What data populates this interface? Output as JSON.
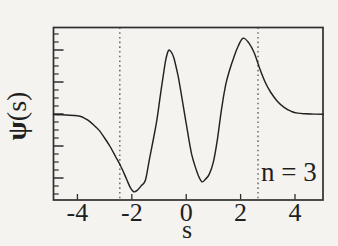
{
  "figure": {
    "ylabel_psi": "ψ",
    "ylabel_rest": "(s)"
  },
  "chart_data": {
    "type": "line",
    "title": "",
    "xlabel": "s",
    "ylabel": "ψ(s)",
    "annotation": "n = 3",
    "grid": false,
    "legend": "none",
    "xlim": [
      -4.88,
      5.03
    ],
    "ylim": [
      -1.117,
      1.13
    ],
    "x_ticks": [
      -4,
      -2,
      0,
      2,
      4
    ],
    "x_tick_labels": [
      "-4",
      "-2",
      "0",
      "2",
      "4"
    ],
    "y_axis": {
      "labeled": false,
      "minor_tick_count": 21,
      "major_every": 4,
      "major_start_index": 2
    },
    "dotted_vlines": [
      -2.44,
      2.64
    ],
    "series": [
      {
        "name": "psi(s), n = 3",
        "x": [
          -4.88,
          -4.6,
          -4.3,
          -4.0,
          -3.8,
          -3.6,
          -3.4,
          -3.2,
          -3.0,
          -2.8,
          -2.6,
          -2.4,
          -2.2,
          -2.05,
          -1.93,
          -1.8,
          -1.65,
          -1.5,
          -1.35,
          -1.2,
          -1.08,
          -0.95,
          -0.85,
          -0.75,
          -0.65,
          -0.55,
          -0.45,
          -0.3,
          -0.2,
          -0.1,
          0.0,
          0.1,
          0.2,
          0.3,
          0.45,
          0.58,
          0.7,
          0.85,
          1.0,
          1.15,
          1.3,
          1.45,
          1.6,
          1.75,
          1.9,
          2.09,
          2.3,
          2.5,
          2.7,
          2.9,
          3.1,
          3.35,
          3.6,
          3.85,
          4.1,
          4.4,
          4.7,
          5.03
        ],
        "y": [
          -0.005,
          -0.007,
          -0.012,
          -0.02,
          -0.04,
          -0.08,
          -0.14,
          -0.21,
          -0.31,
          -0.42,
          -0.55,
          -0.68,
          -0.84,
          -0.96,
          -1.01,
          -0.99,
          -0.93,
          -0.86,
          -0.58,
          -0.31,
          -0.08,
          0.25,
          0.49,
          0.71,
          0.83,
          0.81,
          0.73,
          0.5,
          0.3,
          0.09,
          -0.12,
          -0.33,
          -0.52,
          -0.65,
          -0.8,
          -0.88,
          -0.85,
          -0.78,
          -0.62,
          -0.32,
          0.07,
          0.38,
          0.58,
          0.74,
          0.88,
          0.99,
          0.93,
          0.8,
          0.6,
          0.42,
          0.29,
          0.17,
          0.09,
          0.04,
          0.015,
          0.006,
          0.002,
          0.0
        ]
      }
    ],
    "colors": {
      "ink": "#1f1f1f",
      "curve": "#222222",
      "border": "#2e2e2e",
      "dotted": "#3a3a3a",
      "background": "#f4f3f0"
    }
  }
}
